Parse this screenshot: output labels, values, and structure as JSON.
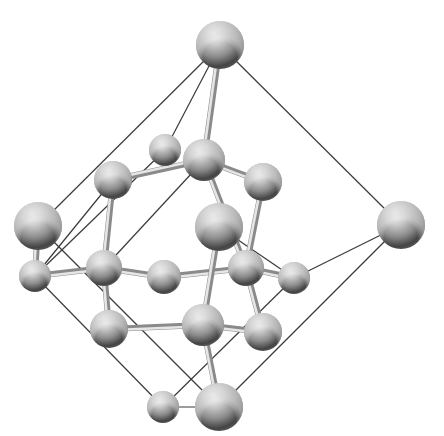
{
  "diagram": {
    "type": "ball-and-stick crystal structure model",
    "width": 444,
    "height": 436,
    "colors": {
      "background": "#ffffff",
      "outline_line": "#3a3a3a",
      "bond_light": "#e6e6e6",
      "bond_dark": "#8a8a8a",
      "sphere_highlight": "#f4f4f4",
      "sphere_mid": "#a8a8a8",
      "sphere_shadow": "#3c3c3c",
      "sphere_rim": "#d8d8d8"
    },
    "atoms": [
      {
        "id": "top",
        "x": 220,
        "y": 45,
        "r": 24
      },
      {
        "id": "u1",
        "x": 165,
        "y": 150,
        "r": 16
      },
      {
        "id": "u2",
        "x": 204,
        "y": 160,
        "r": 21
      },
      {
        "id": "u3",
        "x": 113,
        "y": 180,
        "r": 19
      },
      {
        "id": "u4",
        "x": 263,
        "y": 182,
        "r": 19
      },
      {
        "id": "left",
        "x": 38,
        "y": 226,
        "r": 24
      },
      {
        "id": "center",
        "x": 219,
        "y": 227,
        "r": 24
      },
      {
        "id": "right",
        "x": 401,
        "y": 225,
        "r": 24
      },
      {
        "id": "m1",
        "x": 35,
        "y": 276,
        "r": 16
      },
      {
        "id": "m2",
        "x": 104,
        "y": 268,
        "r": 18
      },
      {
        "id": "m3",
        "x": 164,
        "y": 277,
        "r": 17
      },
      {
        "id": "m4",
        "x": 246,
        "y": 268,
        "r": 18
      },
      {
        "id": "m5",
        "x": 294,
        "y": 278,
        "r": 16
      },
      {
        "id": "l1",
        "x": 109,
        "y": 329,
        "r": 19
      },
      {
        "id": "l2",
        "x": 203,
        "y": 325,
        "r": 21
      },
      {
        "id": "l3",
        "x": 263,
        "y": 332,
        "r": 19
      },
      {
        "id": "b1",
        "x": 163,
        "y": 407,
        "r": 16
      },
      {
        "id": "b2",
        "x": 219,
        "y": 407,
        "r": 24
      }
    ],
    "bonds": [
      [
        "top",
        "u2"
      ],
      [
        "u2",
        "u3"
      ],
      [
        "u2",
        "u4"
      ],
      [
        "u2",
        "m4"
      ],
      [
        "u3",
        "m2"
      ],
      [
        "u4",
        "m4"
      ],
      [
        "m1",
        "m2"
      ],
      [
        "m2",
        "m3"
      ],
      [
        "m3",
        "m4"
      ],
      [
        "m4",
        "m5"
      ],
      [
        "m2",
        "l1"
      ],
      [
        "m4",
        "l3"
      ],
      [
        "center",
        "l2"
      ],
      [
        "l1",
        "l2"
      ],
      [
        "l2",
        "l3"
      ],
      [
        "l2",
        "b2"
      ],
      [
        "left",
        "m1"
      ]
    ],
    "outlines": [
      [
        "top",
        "left"
      ],
      [
        "top",
        "u1"
      ],
      [
        "top",
        "right"
      ],
      [
        "right",
        "m5"
      ],
      [
        "right",
        "b2"
      ],
      [
        "left",
        "b2"
      ],
      [
        "m1",
        "b1"
      ],
      [
        "b1",
        "b2"
      ],
      [
        "u1",
        "m1"
      ],
      [
        "u3",
        "m1"
      ],
      [
        "center",
        "m5"
      ],
      [
        "m5",
        "b1"
      ],
      [
        "u2",
        "m2"
      ]
    ]
  }
}
